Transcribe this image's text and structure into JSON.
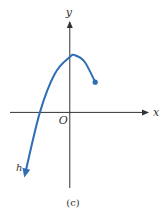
{
  "chart_data": {
    "type": "line",
    "title": "",
    "caption": "(c)",
    "xlabel": "x",
    "ylabel": "y",
    "origin_label": "O",
    "xlim": [
      -4,
      5.5
    ],
    "ylim": [
      -4.5,
      5.5
    ],
    "grid": false,
    "series": [
      {
        "name": "h",
        "color": "#2f6db5",
        "left_end": "arrow",
        "right_end": "closed-dot",
        "points": [
          [
            -3.0,
            -3.7
          ],
          [
            -2.0,
            0
          ],
          [
            -1.0,
            2.3
          ],
          [
            0.0,
            3.3
          ],
          [
            0.35,
            3.4
          ],
          [
            1.0,
            3.0
          ],
          [
            1.7,
            1.8
          ]
        ]
      }
    ]
  }
}
